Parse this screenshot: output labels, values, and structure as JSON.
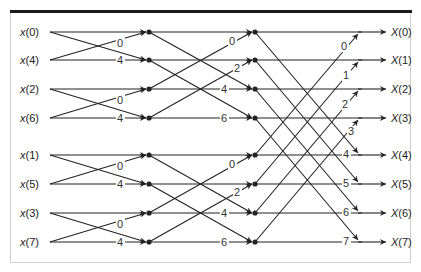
{
  "diagram": {
    "type": "8-point radix-2 decimation-in-time FFT butterfly",
    "inputs": [
      "x(0)",
      "x(4)",
      "x(2)",
      "x(6)",
      "x(1)",
      "x(5)",
      "x(3)",
      "x(7)"
    ],
    "outputs": [
      "X(0)",
      "X(1)",
      "X(2)",
      "X(3)",
      "X(4)",
      "X(5)",
      "X(6)",
      "X(7)"
    ],
    "stage1_twiddles": [
      "0",
      "4",
      "0",
      "4",
      "0",
      "4",
      "0",
      "4"
    ],
    "stage2_twiddles": [
      "0",
      "2",
      "4",
      "6",
      "0",
      "2",
      "4",
      "6"
    ],
    "stage3_twiddles": [
      "0",
      "1",
      "2",
      "3",
      "4",
      "5",
      "6",
      "7"
    ],
    "colors": {
      "line": "#222222",
      "frame": "#cfcfcf",
      "topbar": "#1a1a1a",
      "background": "#ffffff"
    }
  }
}
